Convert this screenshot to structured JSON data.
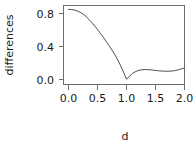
{
  "chart_data": {
    "type": "line",
    "title": "",
    "xlabel": "d",
    "ylabel": "differences",
    "xlim": [
      0.0,
      2.0
    ],
    "ylim": [
      0.0,
      0.88
    ],
    "grid": false,
    "legend": null,
    "box": true,
    "xticks": [
      0.0,
      0.5,
      1.0,
      1.5,
      2.0
    ],
    "xticklabels": [
      "0.0",
      "0.5",
      "1.0",
      "1.5",
      "2.0"
    ],
    "yticks": [
      0.0,
      0.4,
      0.8
    ],
    "yticklabels": [
      "0.0",
      "0.4",
      "0.8"
    ],
    "series": [
      {
        "name": "differences",
        "x": [
          0.0,
          0.05,
          0.1,
          0.15,
          0.2,
          0.25,
          0.3,
          0.35,
          0.4,
          0.45,
          0.5,
          0.55,
          0.6,
          0.65,
          0.7,
          0.75,
          0.8,
          0.85,
          0.9,
          0.95,
          1.0,
          1.05,
          1.1,
          1.15,
          1.2,
          1.25,
          1.3,
          1.35,
          1.4,
          1.45,
          1.5,
          1.55,
          1.6,
          1.65,
          1.7,
          1.75,
          1.8,
          1.85,
          1.9,
          1.95,
          2.0
        ],
        "y": [
          0.85,
          0.848,
          0.842,
          0.831,
          0.815,
          0.794,
          0.766,
          0.731,
          0.692,
          0.65,
          0.606,
          0.56,
          0.512,
          0.462,
          0.41,
          0.356,
          0.3,
          0.236,
          0.166,
          0.086,
          0.004,
          0.038,
          0.072,
          0.094,
          0.108,
          0.116,
          0.12,
          0.12,
          0.118,
          0.114,
          0.11,
          0.106,
          0.103,
          0.101,
          0.1,
          0.101,
          0.104,
          0.11,
          0.119,
          0.13,
          0.14
        ]
      }
    ]
  },
  "axis": {
    "ylabel": "differences",
    "xlabel": "d",
    "xtick_labels": [
      "0.0",
      "0.5",
      "1.0",
      "1.5",
      "2.0"
    ],
    "ytick_labels": [
      "0.0",
      "0.4",
      "0.8"
    ]
  },
  "colors": {
    "curve": "#4d4d4d",
    "axis": "#6e6e6e",
    "text": "#1a1a1a",
    "background": "#ffffff"
  }
}
